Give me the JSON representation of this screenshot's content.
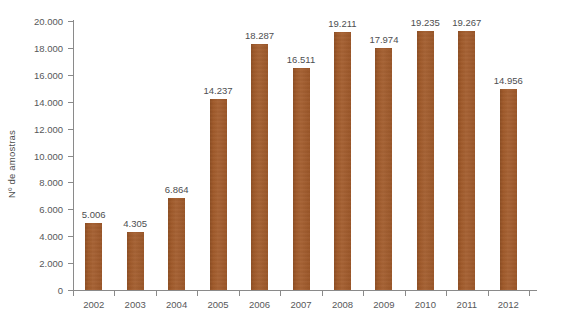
{
  "chart_data": {
    "type": "bar",
    "title": "",
    "subtitle": "",
    "xlabel": "",
    "ylabel": "Nº de amostras",
    "categories": [
      "2002",
      "2003",
      "2004",
      "2005",
      "2006",
      "2007",
      "2008",
      "2009",
      "2010",
      "2011",
      "2012"
    ],
    "values": [
      5006,
      4305,
      6864,
      14237,
      18287,
      16511,
      19211,
      17974,
      19235,
      19267,
      14956
    ],
    "value_labels": [
      "5.006",
      "4.305",
      "6.864",
      "14.237",
      "18.287",
      "16.511",
      "19.211",
      "17.974",
      "19.235",
      "19.267",
      "14.956"
    ],
    "ylim": [
      0,
      20000
    ],
    "ytick_values": [
      0,
      2000,
      4000,
      6000,
      8000,
      10000,
      12000,
      14000,
      16000,
      18000,
      20000
    ],
    "ytick_labels": [
      "0",
      "2.000",
      "4.000",
      "6.000",
      "8.000",
      "10.000",
      "12.000",
      "14.000",
      "16.000",
      "18.000",
      "20.000"
    ],
    "grid": false,
    "legend": false,
    "legend_position": "none",
    "series": [
      {
        "name": "Nº de amostras",
        "color": "#a35b2a",
        "values": [
          5006,
          4305,
          6864,
          14237,
          18287,
          16511,
          19211,
          17974,
          19235,
          19267,
          14956
        ]
      }
    ],
    "colors": {
      "bar": "#a35b2a",
      "axis": "#8a8a8a",
      "tick_text": "#57585a",
      "label_text": "#4d4e50",
      "background": "#ffffff"
    }
  }
}
